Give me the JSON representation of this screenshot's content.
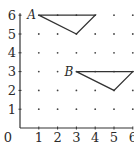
{
  "diagram": {
    "type": "coordinate-grid-with-triangles",
    "axes": {
      "x_ticks": [
        "0",
        "1",
        "2",
        "3",
        "4",
        "5",
        "6"
      ],
      "y_ticks": [
        "1",
        "2",
        "3",
        "4",
        "5",
        "6"
      ],
      "origin_label": "0",
      "xlim": [
        0,
        6
      ],
      "ylim": [
        0,
        6
      ]
    },
    "grid": {
      "style": "dots",
      "spacing": 1
    },
    "shapes": [
      {
        "label": "A",
        "vertices": [
          [
            1,
            6
          ],
          [
            4,
            6
          ],
          [
            3,
            5
          ]
        ]
      },
      {
        "label": "B",
        "vertices": [
          [
            3,
            3
          ],
          [
            6,
            3
          ],
          [
            5,
            2
          ]
        ]
      }
    ],
    "colors": {
      "line": "#333333",
      "dot": "#444444",
      "text": "#2a2a2a"
    }
  }
}
